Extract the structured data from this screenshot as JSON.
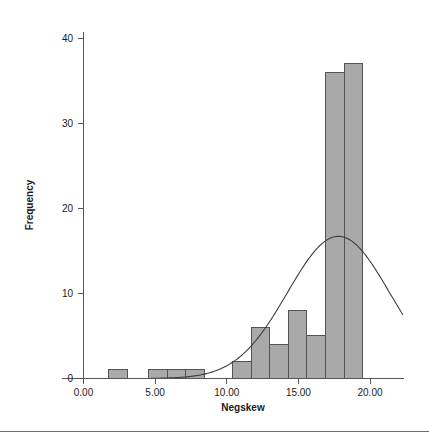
{
  "chart_data": {
    "type": "bar",
    "title": "",
    "subtitle": "",
    "xlabel": "Negskew",
    "ylabel": "Frequency",
    "xlim": [
      -1.5,
      22.5
    ],
    "ylim": [
      0,
      42
    ],
    "grid": false,
    "legend": null,
    "xticks": [
      "0.00",
      "5.00",
      "10.00",
      "15.00",
      "20.00"
    ],
    "xtick_values": [
      0,
      5,
      10,
      15,
      20
    ],
    "yticks": [
      "0",
      "10",
      "20",
      "30",
      "40"
    ],
    "ytick_values": [
      0,
      10,
      20,
      30,
      40
    ],
    "bin_width": 1.3,
    "bars": [
      {
        "x0": 1.75,
        "x1": 3.05,
        "value": 1
      },
      {
        "x0": 4.55,
        "x1": 5.85,
        "value": 1
      },
      {
        "x0": 5.85,
        "x1": 7.15,
        "value": 1
      },
      {
        "x0": 7.15,
        "x1": 8.45,
        "value": 1
      },
      {
        "x0": 10.4,
        "x1": 11.7,
        "value": 2
      },
      {
        "x0": 11.7,
        "x1": 13.0,
        "value": 6
      },
      {
        "x0": 13.0,
        "x1": 14.3,
        "value": 4
      },
      {
        "x0": 14.3,
        "x1": 15.6,
        "value": 8
      },
      {
        "x0": 15.6,
        "x1": 16.9,
        "value": 5
      },
      {
        "x0": 16.9,
        "x1": 18.2,
        "value": 36
      },
      {
        "x0": 18.2,
        "x1": 19.5,
        "value": 37
      }
    ],
    "normal_curve": {
      "label": "normal-distribution-curve",
      "mean": 17.8,
      "peak_value": 16.7,
      "start_x": 4.7,
      "end_x": 22.3
    },
    "colors": {
      "bar_fill": "#a9a9a9",
      "bar_stroke": "#545454",
      "axis": "#555555",
      "curve": "#3c3c3c",
      "text": "#1a1a1a",
      "background": "#ffffff",
      "rule": "#6f6f6f"
    }
  },
  "axis_titles": {
    "x": "Negskew",
    "y": "Frequency"
  }
}
